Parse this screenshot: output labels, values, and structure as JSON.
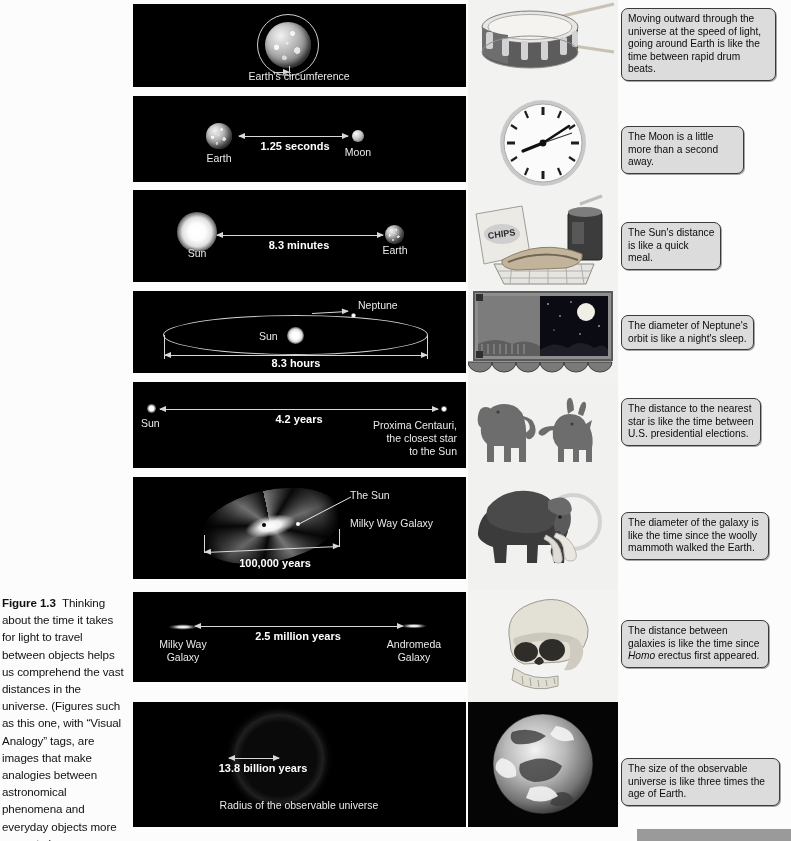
{
  "figure": {
    "label": "Figure 1.3",
    "caption": "Thinking about the time it takes for light to travel between objects helps us comprehend the vast distances in the universe. (Figures such as this one, with “Visual Analogy” tags, are images that make analogies between astronomical phenomena and everyday objects more concrete.)"
  },
  "rows": [
    {
      "id": "earth-circumference",
      "diagram": {
        "object_labels": [
          "Earth's circumference"
        ],
        "value": "1/7 second",
        "value_numerator": "1",
        "value_denominator": "7",
        "value_unit": "second"
      },
      "photo": {
        "name": "snare-drum-photo",
        "alt": "snare drum with drumsticks"
      },
      "callout": "Moving outward through the universe at the speed of light, going around Earth is like the time between rapid drum beats."
    },
    {
      "id": "earth-moon",
      "diagram": {
        "left_label": "Earth",
        "right_label": "Moon",
        "value": "1.25 seconds"
      },
      "photo": {
        "name": "wall-clock-photo",
        "alt": "round analog wall clock"
      },
      "callout": "The Moon is a little more than a second away."
    },
    {
      "id": "sun-earth",
      "diagram": {
        "left_label": "Sun",
        "right_label": "Earth",
        "value": "8.3 minutes"
      },
      "photo": {
        "name": "quick-meal-photo",
        "alt": "bag of chips, sandwich in basket and soda cup",
        "chips_label": "CHIPS"
      },
      "callout": "The Sun's distance is like a quick meal."
    },
    {
      "id": "neptune-orbit",
      "diagram": {
        "center_label": "Sun",
        "orbit_label": "Neptune",
        "value": "8.3 hours"
      },
      "photo": {
        "name": "night-window-photo",
        "alt": "window at night with full moon"
      },
      "callout": "The diameter of Neptune's orbit is like a night's sleep."
    },
    {
      "id": "proxima-centauri",
      "diagram": {
        "left_label": "Sun",
        "right_label": "Proxima Centauri,\nthe closest star\nto the Sun",
        "value": "4.2 years"
      },
      "photo": {
        "name": "election-animals-photo",
        "alt": "elephant and donkey under patriotic bunting"
      },
      "callout": "The distance to the nearest star is like the time between U.S. presidential elections."
    },
    {
      "id": "milky-way-diameter",
      "diagram": {
        "pointer_label": "The Sun",
        "galaxy_label": "Milky Way Galaxy",
        "value": "100,000 years"
      },
      "photo": {
        "name": "woolly-mammoth-photo",
        "alt": "woolly mammoth"
      },
      "callout": "The diameter of the galaxy is like the time since the woolly mammoth walked the Earth."
    },
    {
      "id": "milky-way-andromeda",
      "diagram": {
        "left_label": "Milky Way\nGalaxy",
        "right_label": "Andromeda\nGalaxy",
        "value": "2.5 million years"
      },
      "photo": {
        "name": "homo-erectus-skull-photo",
        "alt": "Homo erectus skull"
      },
      "callout_pre": "The distance between galaxies is like the time since ",
      "callout_italic": "Homo",
      "callout_post": " erectus first appeared."
    },
    {
      "id": "observable-universe",
      "diagram": {
        "value": "13.8 billion years",
        "caption": "Radius of the observable universe"
      },
      "photo": {
        "name": "earth-from-space-photo",
        "alt": "Earth seen from space"
      },
      "callout": "The size of the observable universe is like three times the age of Earth."
    }
  ]
}
